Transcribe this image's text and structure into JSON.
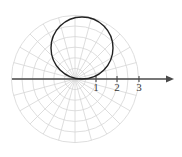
{
  "figure": {
    "type": "polar-plot",
    "background_color": "#ffffff",
    "pole": {
      "x": 75,
      "y": 79
    },
    "unit_px": 21.2
  },
  "chart_data": {
    "type": "line",
    "coordinate_system": "polar",
    "title": "",
    "xlabel": "",
    "ylabel": "",
    "grid": true,
    "legend": null,
    "axis": {
      "name": "polar-axis",
      "direction": "horizontal-right",
      "arrow": true,
      "color": "#4a4a4a",
      "start_x": 12,
      "end_x": 174,
      "y": 79,
      "tick_labels": [
        "1",
        "2",
        "3"
      ],
      "tick_values": [
        1,
        2,
        3
      ],
      "tick_x": [
        96,
        117,
        139
      ],
      "tick_label_y": 91
    },
    "grid_spec": {
      "ring_color": "#d6d6d6",
      "ray_color": "#d6d6d6",
      "ring_radii_units": [
        0.5,
        1.0,
        1.5,
        2.0,
        2.5,
        3.0
      ],
      "ring_radii_px": [
        10.6,
        21.2,
        31.8,
        42.4,
        53.0,
        63.6
      ],
      "ray_angles_deg": [
        0,
        15,
        30,
        45,
        60,
        75,
        90,
        105,
        120,
        135,
        150,
        165,
        180,
        195,
        210,
        225,
        240,
        255,
        270,
        285,
        300,
        315,
        330,
        345
      ],
      "ray_length_px": 63.6
    },
    "series": [
      {
        "name": "r = 3 sin(theta)",
        "curve": "circle",
        "color": "#222222",
        "line_width": 1.4,
        "description": "circle tangent to polar axis at the pole, opening upward",
        "center_px": {
          "x": 82,
          "y": 48
        },
        "radius_px": 31,
        "center_polar": {
          "r": 1.5,
          "theta_deg": 90
        },
        "radius_units": 1.5,
        "max_r": 3,
        "max_r_angle_deg": 90
      }
    ]
  }
}
